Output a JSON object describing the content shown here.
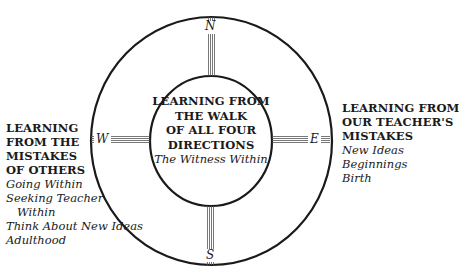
{
  "diagram": {
    "colors": {
      "ink": "#1a1a1a",
      "background": "#ffffff"
    },
    "directions": {
      "north": "N",
      "east": "E",
      "south": "S",
      "west": "W"
    },
    "center": {
      "heading_lines": [
        "LEARNING FROM",
        "THE WALK",
        "OF ALL FOUR",
        "DIRECTIONS"
      ],
      "subtitle": "The Witness Within"
    },
    "west": {
      "heading_lines": [
        "LEARNING",
        "FROM THE",
        "MISTAKES",
        "OF OTHERS"
      ],
      "items": [
        "Going Within",
        "Seeking Teacher",
        "Within",
        "Think About New Ideas",
        "Adulthood"
      ]
    },
    "east": {
      "heading_lines": [
        "LEARNING FROM",
        "OUR TEACHER'S",
        "MISTAKES"
      ],
      "items": [
        "New Ideas",
        "Beginnings",
        "Birth"
      ]
    }
  }
}
